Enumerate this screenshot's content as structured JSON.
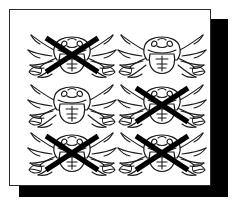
{
  "figure": {
    "background_color": "#ffffff",
    "page_color": "#ffffff",
    "page_border_color": "#2b2b2b",
    "shadow_color": "#000000",
    "ink_color": "#1a1a1a",
    "cross_color": "#000000"
  },
  "grid": {
    "columns": 2,
    "rows": 3,
    "total_items": 6,
    "crossed_count": 4,
    "uncrossed_count": 2,
    "cells": [
      {
        "id": "crab-r1c1",
        "row": 1,
        "column": 1,
        "icon": "crab-icon",
        "crossed_out": true,
        "x": 14,
        "y": 18
      },
      {
        "id": "crab-r1c2",
        "row": 1,
        "column": 2,
        "icon": "crab-icon",
        "crossed_out": false,
        "x": 104,
        "y": 18
      },
      {
        "id": "crab-r2c1",
        "row": 2,
        "column": 1,
        "icon": "crab-icon",
        "crossed_out": false,
        "x": 14,
        "y": 68
      },
      {
        "id": "crab-r2c2",
        "row": 2,
        "column": 2,
        "icon": "crab-icon",
        "crossed_out": true,
        "x": 104,
        "y": 68
      },
      {
        "id": "crab-r3c1",
        "row": 3,
        "column": 1,
        "icon": "crab-icon",
        "crossed_out": true,
        "x": 14,
        "y": 116
      },
      {
        "id": "crab-r3c2",
        "row": 3,
        "column": 2,
        "icon": "crab-icon",
        "crossed_out": true,
        "x": 104,
        "y": 116
      }
    ]
  }
}
